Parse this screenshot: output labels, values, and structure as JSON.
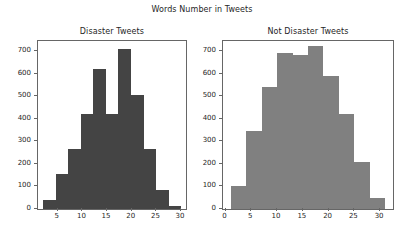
{
  "figure": {
    "suptitle": "Words Number in Tweets",
    "background": "#ffffff"
  },
  "chart_data": [
    {
      "type": "bar",
      "title": "Disaster Tweets",
      "subplot_index": 0,
      "xlabel": "",
      "ylabel": "",
      "grid": false,
      "legend": false,
      "color": "#444444",
      "bin_edges": [
        2,
        4.55,
        7.1,
        9.65,
        12.2,
        14.75,
        17.3,
        19.85,
        22.4,
        24.95,
        27.5,
        30.05
      ],
      "categories": [
        "2-4.6",
        "4.6-7.1",
        "7.1-9.7",
        "9.7-12.2",
        "12.2-14.8",
        "14.8-17.3",
        "17.3-19.9",
        "19.9-22.4",
        "22.4-25",
        "25-27.5",
        "27.5-30"
      ],
      "values": [
        40,
        155,
        265,
        420,
        620,
        420,
        710,
        505,
        265,
        85,
        15
      ],
      "xlim": [
        1.0,
        31.0
      ],
      "ylim": [
        0,
        745
      ],
      "xticks": [
        5,
        10,
        15,
        20,
        25,
        30
      ],
      "xticklabels": [
        "5",
        "10",
        "15",
        "20",
        "25",
        "30"
      ],
      "yticks": [
        0,
        100,
        200,
        300,
        400,
        500,
        600,
        700
      ],
      "yticklabels": [
        "0",
        "100",
        "200",
        "300",
        "400",
        "500",
        "600",
        "700"
      ]
    },
    {
      "type": "bar",
      "title": "Not Disaster Tweets",
      "subplot_index": 1,
      "xlabel": "",
      "ylabel": "",
      "grid": false,
      "legend": false,
      "color": "#808080",
      "bin_edges": [
        1,
        4,
        7,
        10,
        13,
        16,
        19,
        22,
        25,
        28,
        31
      ],
      "categories": [
        "1-4",
        "4-7",
        "7-10",
        "10-13",
        "13-16",
        "16-19",
        "19-22",
        "22-25",
        "25-28",
        "28-31"
      ],
      "values": [
        100,
        345,
        540,
        690,
        685,
        725,
        590,
        420,
        207,
        48
      ],
      "xlim": [
        -0.5,
        32.5
      ],
      "ylim": [
        0,
        745
      ],
      "xticks": [
        0,
        5,
        10,
        15,
        20,
        25,
        30
      ],
      "xticklabels": [
        "0",
        "5",
        "10",
        "15",
        "20",
        "25",
        "30"
      ],
      "yticks": [
        0,
        100,
        200,
        300,
        400,
        500,
        600,
        700
      ],
      "yticklabels": [
        "0",
        "100",
        "200",
        "300",
        "400",
        "500",
        "600",
        "700"
      ]
    }
  ]
}
